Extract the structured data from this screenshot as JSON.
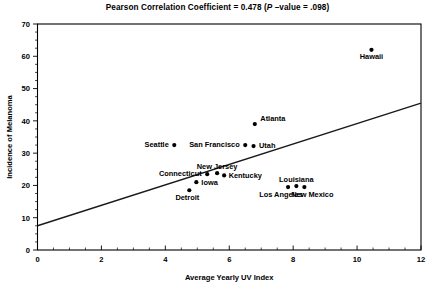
{
  "chart_data": {
    "type": "scatter",
    "title": "Pearson Correlation Coefficient = 0.478 (P –value = .098)",
    "title_parts": {
      "prefix": "Pearson Correlation Coefficient = 0.478 (",
      "italic": "P",
      "suffix": " –value = .098)"
    },
    "statistics": {
      "pearson_r": 0.478,
      "p_value": 0.098
    },
    "xlabel": "Average Yearly UV Index",
    "ylabel": "Incidence of Melanoma",
    "xlim": [
      0,
      12
    ],
    "ylim": [
      0,
      70
    ],
    "xticks": [
      0,
      2,
      4,
      6,
      8,
      10,
      12
    ],
    "yticks": [
      0,
      10,
      20,
      30,
      40,
      50,
      60,
      70
    ],
    "xtick_labels": [
      "0",
      "2",
      "4",
      "6",
      "8",
      "10",
      "12"
    ],
    "ytick_labels": [
      "0",
      "10",
      "20",
      "30",
      "40",
      "50",
      "60",
      "70"
    ],
    "x_minor_step": 0.5,
    "y_minor_step": 2.5,
    "grid": false,
    "legend": "none",
    "marker": "filled-circle",
    "marker_color": "#000000",
    "trendline": {
      "type": "linear-fit",
      "x_start": 0,
      "y_start": 7.5,
      "x_end": 12,
      "y_end": 45.5,
      "color": "#1a1a1a"
    },
    "points": [
      {
        "label": "Hawaii",
        "x": 10.45,
        "y": 62.0,
        "label_dx": 0,
        "label_dy": 9.5,
        "anchor": "middle"
      },
      {
        "label": "Atlanta",
        "x": 6.8,
        "y": 39.0,
        "label_dx": 5.5,
        "label_dy": -3.5,
        "anchor": "start"
      },
      {
        "label": "Seattle",
        "x": 4.28,
        "y": 32.5,
        "label_dx": -5.5,
        "label_dy": 2.0,
        "anchor": "end"
      },
      {
        "label": "San Francisco",
        "x": 6.5,
        "y": 32.5,
        "label_dx": -5.5,
        "label_dy": 2.0,
        "anchor": "end"
      },
      {
        "label": "Utah",
        "x": 6.76,
        "y": 32.2,
        "label_dx": 5.5,
        "label_dy": 2.0,
        "anchor": "start"
      },
      {
        "label": "Connecticut",
        "x": 5.31,
        "y": 23.5,
        "label_dx": -5.5,
        "label_dy": 2.0,
        "anchor": "end"
      },
      {
        "label": "New Jersey",
        "x": 5.62,
        "y": 23.8,
        "label_dx": 0,
        "label_dy": -4.5,
        "anchor": "middle"
      },
      {
        "label": "Kentucky",
        "x": 5.84,
        "y": 23.1,
        "label_dx": 4.5,
        "label_dy": 2.5,
        "anchor": "start"
      },
      {
        "label": "Iowa",
        "x": 4.97,
        "y": 21.0,
        "label_dx": 5.0,
        "label_dy": 2.5,
        "anchor": "start"
      },
      {
        "label": "Detroit",
        "x": 4.75,
        "y": 18.5,
        "label_dx": -2.0,
        "label_dy": 10.0,
        "anchor": "middle"
      },
      {
        "label": "Los Angeles",
        "x": 7.84,
        "y": 19.5,
        "label_dx": -7.0,
        "label_dy": 10.0,
        "anchor": "middle"
      },
      {
        "label": "Louisiana",
        "x": 8.1,
        "y": 19.8,
        "label_dx": 0,
        "label_dy": -4.5,
        "anchor": "middle"
      },
      {
        "label": "New Mexico",
        "x": 8.35,
        "y": 19.5,
        "label_dx": 8.0,
        "label_dy": 10.0,
        "anchor": "middle"
      }
    ]
  }
}
